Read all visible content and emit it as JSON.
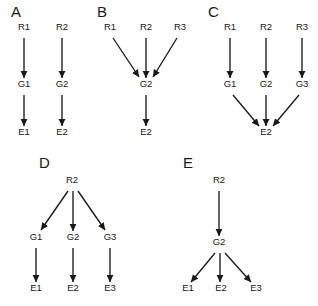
{
  "figure": {
    "background_color": "#ffffff",
    "ink_color": "#1a1a1a"
  },
  "panels": [
    {
      "letter": "A",
      "letter_x": 11,
      "letter_y": 17,
      "nodes": [
        {
          "label": "R1",
          "x": 24,
          "y": 30
        },
        {
          "label": "R2",
          "x": 62,
          "y": 30
        },
        {
          "label": "G1",
          "x": 24,
          "y": 87
        },
        {
          "label": "G2",
          "x": 62,
          "y": 87
        },
        {
          "label": "E1",
          "x": 24,
          "y": 135
        },
        {
          "label": "E2",
          "x": 62,
          "y": 135
        }
      ],
      "edges": [
        {
          "x1": 24,
          "y1": 38,
          "x2": 24,
          "y2": 78
        },
        {
          "x1": 62,
          "y1": 38,
          "x2": 62,
          "y2": 78
        },
        {
          "x1": 24,
          "y1": 95,
          "x2": 24,
          "y2": 126
        },
        {
          "x1": 62,
          "y1": 95,
          "x2": 62,
          "y2": 126
        }
      ]
    },
    {
      "letter": "B",
      "letter_x": 97,
      "letter_y": 17,
      "nodes": [
        {
          "label": "R1",
          "x": 110,
          "y": 30
        },
        {
          "label": "R2",
          "x": 146,
          "y": 30
        },
        {
          "label": "R3",
          "x": 180,
          "y": 30
        },
        {
          "label": "G2",
          "x": 146,
          "y": 87
        },
        {
          "label": "E2",
          "x": 146,
          "y": 135
        }
      ],
      "edges": [
        {
          "x1": 113,
          "y1": 38,
          "x2": 139,
          "y2": 77
        },
        {
          "x1": 146,
          "y1": 38,
          "x2": 146,
          "y2": 78
        },
        {
          "x1": 177,
          "y1": 38,
          "x2": 153,
          "y2": 77
        },
        {
          "x1": 146,
          "y1": 95,
          "x2": 146,
          "y2": 126
        }
      ]
    },
    {
      "letter": "C",
      "letter_x": 208,
      "letter_y": 17,
      "nodes": [
        {
          "label": "R1",
          "x": 230,
          "y": 30
        },
        {
          "label": "R2",
          "x": 266,
          "y": 30
        },
        {
          "label": "R3",
          "x": 302,
          "y": 30
        },
        {
          "label": "G1",
          "x": 230,
          "y": 87
        },
        {
          "label": "G2",
          "x": 266,
          "y": 87
        },
        {
          "label": "G3",
          "x": 302,
          "y": 87
        },
        {
          "label": "E2",
          "x": 266,
          "y": 135
        }
      ],
      "edges": [
        {
          "x1": 230,
          "y1": 38,
          "x2": 230,
          "y2": 78
        },
        {
          "x1": 266,
          "y1": 38,
          "x2": 266,
          "y2": 78
        },
        {
          "x1": 302,
          "y1": 38,
          "x2": 302,
          "y2": 78
        },
        {
          "x1": 233,
          "y1": 95,
          "x2": 259,
          "y2": 126
        },
        {
          "x1": 266,
          "y1": 95,
          "x2": 266,
          "y2": 126
        },
        {
          "x1": 299,
          "y1": 95,
          "x2": 273,
          "y2": 126
        }
      ]
    },
    {
      "letter": "D",
      "letter_x": 39,
      "letter_y": 168,
      "nodes": [
        {
          "label": "R2",
          "x": 72,
          "y": 183
        },
        {
          "label": "G1",
          "x": 36,
          "y": 240
        },
        {
          "label": "G2",
          "x": 73,
          "y": 240
        },
        {
          "label": "G3",
          "x": 110,
          "y": 240
        },
        {
          "label": "E1",
          "x": 36,
          "y": 291
        },
        {
          "label": "E2",
          "x": 73,
          "y": 291
        },
        {
          "label": "E3",
          "x": 110,
          "y": 291
        }
      ],
      "edges": [
        {
          "x1": 68,
          "y1": 191,
          "x2": 41,
          "y2": 230
        },
        {
          "x1": 73,
          "y1": 191,
          "x2": 73,
          "y2": 231
        },
        {
          "x1": 78,
          "y1": 191,
          "x2": 105,
          "y2": 230
        },
        {
          "x1": 36,
          "y1": 248,
          "x2": 36,
          "y2": 282
        },
        {
          "x1": 73,
          "y1": 248,
          "x2": 73,
          "y2": 282
        },
        {
          "x1": 110,
          "y1": 248,
          "x2": 110,
          "y2": 282
        }
      ]
    },
    {
      "letter": "E",
      "letter_x": 183,
      "letter_y": 168,
      "nodes": [
        {
          "label": "R2",
          "x": 219,
          "y": 183
        },
        {
          "label": "G2",
          "x": 219,
          "y": 245
        },
        {
          "label": "E1",
          "x": 188,
          "y": 291
        },
        {
          "label": "E2",
          "x": 221,
          "y": 291
        },
        {
          "label": "E3",
          "x": 256,
          "y": 291
        }
      ],
      "edges": [
        {
          "x1": 219,
          "y1": 191,
          "x2": 219,
          "y2": 236
        },
        {
          "x1": 215,
          "y1": 253,
          "x2": 191,
          "y2": 282
        },
        {
          "x1": 220,
          "y1": 253,
          "x2": 220,
          "y2": 282
        },
        {
          "x1": 225,
          "y1": 253,
          "x2": 251,
          "y2": 282
        }
      ]
    }
  ]
}
